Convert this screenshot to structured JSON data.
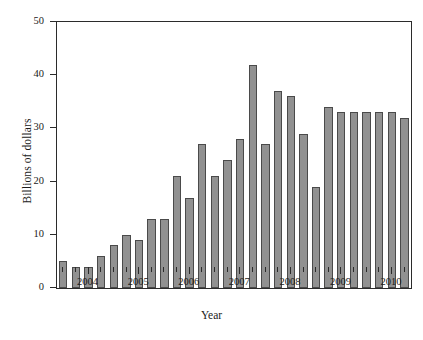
{
  "chart_data": {
    "type": "bar",
    "title": "",
    "xlabel": "Year",
    "ylabel": "Billions of dollars",
    "ylim": [
      0,
      50
    ],
    "yticks": [
      0,
      10,
      20,
      30,
      40,
      50
    ],
    "grid": false,
    "legend": null,
    "bar_color": "#919191",
    "bar_edge_color": "#4a4a4a",
    "axis_color": "#2b2b2b",
    "categories": [
      "2003 Q3",
      "2003 Q4",
      "2004 Q1",
      "2004 Q2",
      "2004 Q3",
      "2004 Q4",
      "2005 Q1",
      "2005 Q2",
      "2005 Q3",
      "2005 Q4",
      "2006 Q1",
      "2006 Q2",
      "2006 Q3",
      "2006 Q4",
      "2007 Q1",
      "2007 Q2",
      "2007 Q3",
      "2007 Q4",
      "2008 Q1",
      "2008 Q2",
      "2008 Q3",
      "2008 Q4",
      "2009 Q1",
      "2009 Q2",
      "2009 Q3",
      "2009 Q4",
      "2010 Q1",
      "2010 Q2"
    ],
    "values": [
      5,
      4,
      4,
      6,
      8,
      10,
      9,
      13,
      13,
      21,
      17,
      27,
      21,
      24,
      28,
      42,
      27,
      37,
      36,
      29,
      19,
      34,
      33,
      33,
      33,
      33,
      33,
      32
    ],
    "xtick_labels": [
      "2004",
      "2005",
      "2006",
      "2007",
      "2008",
      "2009",
      "2010"
    ]
  },
  "axis": {
    "y_title": "Billions of dollars",
    "x_title": "Year"
  }
}
